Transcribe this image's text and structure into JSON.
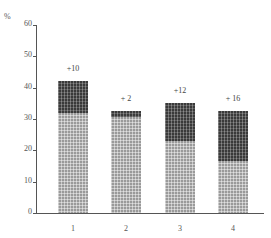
{
  "chart_data": {
    "type": "bar",
    "stacked": true,
    "title": "",
    "xlabel": "",
    "ylabel": "%",
    "ylim": [
      0,
      60
    ],
    "yticks": [
      0,
      10,
      20,
      30,
      40,
      50,
      60
    ],
    "grid": false,
    "legend": null,
    "categories": [
      "1",
      "2",
      "3",
      "4"
    ],
    "series": [
      {
        "name": "base",
        "values": [
          32,
          30.5,
          23,
          16.5
        ],
        "color": "#9a9a9a"
      },
      {
        "name": "increment",
        "values": [
          10,
          2,
          12,
          16
        ],
        "color": "#3a3a3a"
      }
    ],
    "totals": [
      42,
      32.5,
      35,
      32.5
    ],
    "annotations": [
      "+10",
      "+ 2",
      "+12",
      "+ 16"
    ]
  },
  "axis": {
    "unit_label": "%",
    "y_tick_labels": [
      "0",
      "10",
      "20",
      "30",
      "40",
      "50",
      "60"
    ],
    "x_tick_labels": [
      "1",
      "2",
      "3",
      "4"
    ]
  }
}
